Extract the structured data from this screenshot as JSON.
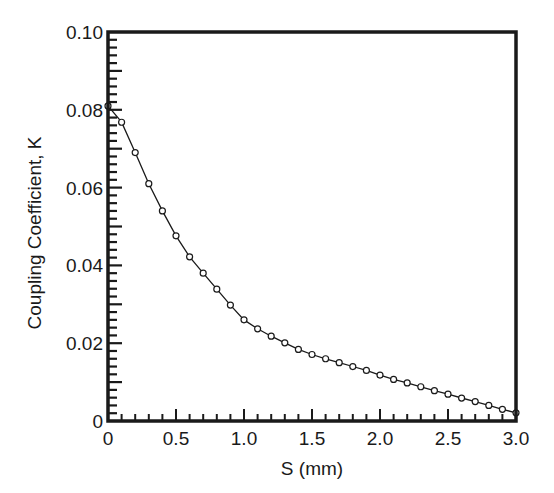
{
  "chart_data": {
    "type": "line",
    "title": "",
    "xlabel": "S (mm)",
    "ylabel": "Coupling Coefficient, K",
    "xlim": [
      0,
      3.0
    ],
    "ylim": [
      0,
      0.1
    ],
    "grid": false,
    "legend": null,
    "x_ticks": [
      "0",
      "0.5",
      "1.0",
      "1.5",
      "2.0",
      "2.5",
      "3.0"
    ],
    "x_tick_values": [
      0,
      0.5,
      1.0,
      1.5,
      2.0,
      2.5,
      3.0
    ],
    "y_ticks": [
      "0",
      "0.02",
      "0.04",
      "0.06",
      "0.08",
      "0.10"
    ],
    "y_tick_values": [
      0,
      0.02,
      0.04,
      0.06,
      0.08,
      0.1
    ],
    "x_minor_step": 0.1,
    "y_minor_step": 0.002,
    "marker": "open-circle",
    "series": [
      {
        "name": "K vs S",
        "color": "#1a1a1a",
        "x": [
          0,
          0.1,
          0.2,
          0.3,
          0.4,
          0.5,
          0.6,
          0.7,
          0.8,
          0.9,
          1.0,
          1.1,
          1.2,
          1.3,
          1.4,
          1.5,
          1.6,
          1.7,
          1.8,
          1.9,
          2.0,
          2.1,
          2.2,
          2.3,
          2.4,
          2.5,
          2.6,
          2.7,
          2.8,
          2.9,
          3.0
        ],
        "values": [
          0.081,
          0.0768,
          0.069,
          0.061,
          0.054,
          0.0476,
          0.0422,
          0.038,
          0.0339,
          0.0298,
          0.026,
          0.0237,
          0.0218,
          0.0201,
          0.0184,
          0.0171,
          0.016,
          0.015,
          0.014,
          0.013,
          0.0118,
          0.0107,
          0.0098,
          0.0088,
          0.0078,
          0.0069,
          0.0059,
          0.005,
          0.004,
          0.003,
          0.0021
        ]
      }
    ]
  },
  "labels": {
    "xlabel": "S (mm)",
    "ylabel": "Coupling Coefficient, K"
  }
}
